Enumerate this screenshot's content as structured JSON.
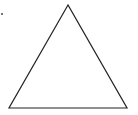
{
  "diagram": {
    "shape": "triangle",
    "stroke_color": "#222222",
    "fill_color": "none",
    "stroke_width": 1.2,
    "vertices": [
      [
        68,
        5
      ],
      [
        9,
        108
      ],
      [
        127,
        108
      ]
    ],
    "marker": {
      "x": 2,
      "y": 14,
      "r": 0.9,
      "color": "#333333"
    }
  }
}
